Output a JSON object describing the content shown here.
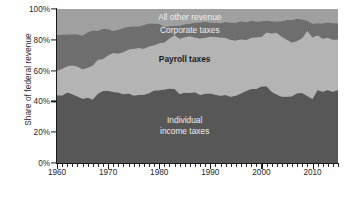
{
  "chart_data": {
    "type": "area",
    "stacked": true,
    "title": "",
    "subtitle": "",
    "xlabel": "",
    "ylabel": "Share of federal revenue",
    "xlim": [
      1960,
      2015
    ],
    "ylim": [
      0,
      100
    ],
    "grid": false,
    "legend_position": "inline-annotations",
    "x_tick_labels": [
      "1960",
      "1970",
      "1980",
      "1990",
      "2000",
      "2010"
    ],
    "x_tick_values": [
      1960,
      1970,
      1980,
      1990,
      2000,
      2010
    ],
    "x_minor_tick_interval": 1,
    "y_tick_labels": [
      "0%",
      "20%",
      "40%",
      "60%",
      "80%",
      "100%"
    ],
    "y_tick_values": [
      0,
      20,
      40,
      60,
      80,
      100
    ],
    "x": [
      1960,
      1961,
      1962,
      1963,
      1964,
      1965,
      1966,
      1967,
      1968,
      1969,
      1970,
      1971,
      1972,
      1973,
      1974,
      1975,
      1976,
      1977,
      1978,
      1979,
      1980,
      1981,
      1982,
      1983,
      1984,
      1985,
      1986,
      1987,
      1988,
      1989,
      1990,
      1991,
      1992,
      1993,
      1994,
      1995,
      1996,
      1997,
      1998,
      1999,
      2000,
      2001,
      2002,
      2003,
      2004,
      2005,
      2006,
      2007,
      2008,
      2009,
      2010,
      2011,
      2012,
      2013,
      2014,
      2015
    ],
    "series": [
      {
        "name": "Individual income taxes",
        "color": "#575757",
        "label_color": "#efefef",
        "values": [
          44.0,
          43.8,
          45.7,
          44.7,
          43.2,
          41.8,
          42.4,
          41.3,
          44.9,
          46.7,
          46.9,
          46.1,
          45.7,
          44.7,
          45.2,
          43.9,
          44.2,
          44.3,
          45.3,
          47.0,
          47.2,
          47.7,
          48.2,
          48.1,
          44.8,
          45.6,
          45.4,
          46.0,
          44.1,
          45.0,
          45.2,
          44.3,
          43.6,
          44.2,
          43.1,
          43.7,
          45.2,
          46.7,
          48.1,
          48.1,
          49.6,
          49.9,
          46.3,
          44.5,
          43.0,
          43.1,
          43.4,
          45.3,
          45.4,
          43.5,
          41.5,
          47.4,
          46.2,
          47.4,
          46.2,
          47.4
        ]
      },
      {
        "name": "Payroll taxes",
        "color": "#b4b4b4",
        "label_color": "#1c1c1c",
        "values": [
          15.9,
          17.4,
          17.1,
          18.6,
          19.5,
          19.0,
          19.5,
          22.0,
          22.2,
          20.9,
          23.0,
          25.3,
          25.4,
          27.3,
          28.5,
          30.3,
          30.5,
          29.9,
          30.3,
          29.4,
          30.5,
          30.5,
          32.6,
          34.8,
          35.9,
          36.1,
          36.9,
          35.5,
          36.8,
          36.3,
          36.8,
          37.5,
          37.9,
          37.1,
          36.7,
          35.8,
          35.1,
          33.2,
          33.2,
          33.5,
          32.2,
          34.9,
          37.8,
          40.0,
          39.0,
          36.9,
          34.8,
          33.9,
          35.7,
          42.3,
          40.0,
          35.5,
          34.5,
          34.0,
          33.9,
          32.8
        ]
      },
      {
        "name": "Corporate taxes",
        "color": "#6e6e6e",
        "label_color": "#efefef",
        "values": [
          23.2,
          22.2,
          20.6,
          20.3,
          20.9,
          21.8,
          23.0,
          22.8,
          18.7,
          19.6,
          17.0,
          14.3,
          15.5,
          15.7,
          14.7,
          14.6,
          13.9,
          15.4,
          15.0,
          14.2,
          12.5,
          10.2,
          8.0,
          6.2,
          8.5,
          8.4,
          8.2,
          9.8,
          10.4,
          10.6,
          9.1,
          9.3,
          9.2,
          10.2,
          11.2,
          11.6,
          11.8,
          11.5,
          11.0,
          10.1,
          10.2,
          7.6,
          8.0,
          7.4,
          10.1,
          12.9,
          14.7,
          14.4,
          12.1,
          6.6,
          8.9,
          7.9,
          9.9,
          9.9,
          10.6,
          10.6
        ]
      },
      {
        "name": "All other revenue",
        "color": "#a0a0a0",
        "label_color": "#efefef",
        "values": [
          16.9,
          16.6,
          16.6,
          16.4,
          16.4,
          17.4,
          15.1,
          13.9,
          14.2,
          12.8,
          13.1,
          14.3,
          13.4,
          12.3,
          11.6,
          11.2,
          11.4,
          10.4,
          9.4,
          9.4,
          9.8,
          11.6,
          11.2,
          10.9,
          10.8,
          9.9,
          9.5,
          8.7,
          8.7,
          8.1,
          8.9,
          8.9,
          9.3,
          8.5,
          9.0,
          8.9,
          7.9,
          8.6,
          7.7,
          8.3,
          8.0,
          7.6,
          7.9,
          8.1,
          7.9,
          7.1,
          7.1,
          6.4,
          6.8,
          7.6,
          9.6,
          9.2,
          9.4,
          8.7,
          9.3,
          9.2
        ]
      }
    ],
    "annotations": [
      {
        "text": "All other revenue",
        "series": "All other revenue",
        "x": 1986,
        "y": 94,
        "style": "light"
      },
      {
        "text": "Corporate taxes",
        "series": "Corporate taxes",
        "x": 1986,
        "y": 86,
        "style": "light"
      },
      {
        "text": "Payroll taxes",
        "series": "Payroll taxes",
        "x": 1985,
        "y": 67,
        "style": "dark"
      },
      {
        "text": "Individual income taxes",
        "series": "Individual income taxes",
        "x": 1985,
        "y": 24,
        "style": "light",
        "lines": [
          "Individual",
          "income taxes"
        ]
      }
    ]
  },
  "axes": {
    "y_title": "Share of federal revenue",
    "y_ticks": [
      "100%",
      "80%",
      "60%",
      "40%",
      "20%",
      "0%"
    ],
    "x_ticks": [
      "1960",
      "1970",
      "1980",
      "1990",
      "2000",
      "2010"
    ]
  },
  "labels": {
    "all_other_revenue": "All other revenue",
    "corporate_taxes": "Corporate taxes",
    "payroll_taxes": "Payroll taxes",
    "individual_line1": "Individual",
    "individual_line2": "income taxes"
  },
  "colors": {
    "individual_income_taxes": "#575757",
    "payroll_taxes": "#b4b4b4",
    "corporate_taxes": "#6e6e6e",
    "all_other_revenue": "#a0a0a0",
    "background": "#ffffff",
    "axis": "#1a1a1a",
    "text": "#1f1f1f"
  }
}
